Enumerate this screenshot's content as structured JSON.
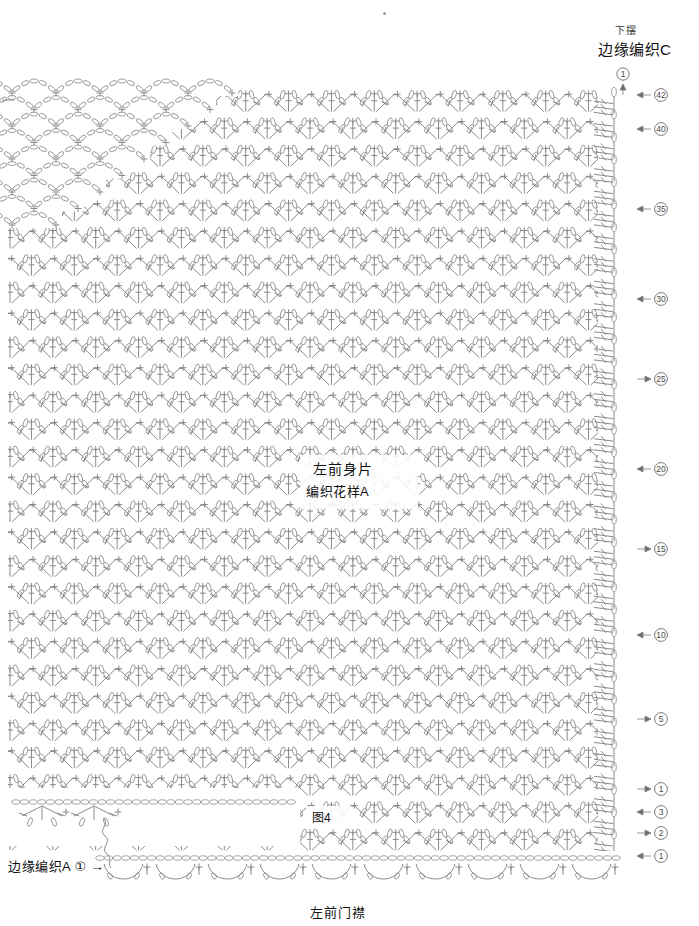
{
  "page": {
    "width": 699,
    "height": 926,
    "background": "#ffffff",
    "line_color": "#8a8a8a",
    "ink_color": "#1a1a1a",
    "figure_id": "图4"
  },
  "labels": {
    "hem": "下摆",
    "edge_c": "边缘编织C",
    "body_piece": "左前身片",
    "pattern_a": "编织花样A",
    "figure": "图4",
    "edge_a": "边缘编织A",
    "edge_a_marker": "①",
    "front_placket": "左前门襟",
    "start_marker": "①"
  },
  "chart_data": {
    "type": "diagram",
    "subtitle": "左前门襟 / 边缘编织A / 边缘编织C",
    "grid": {
      "pattern_area": {
        "x": 10,
        "y": 88,
        "width": 600,
        "height": 766
      },
      "rows_total": 42,
      "motif_columns": 14,
      "motif_rows": 28
    },
    "row_markers": [
      {
        "label": "42",
        "y": 95,
        "arrow": "left"
      },
      {
        "label": "40",
        "y": 129,
        "arrow": "left"
      },
      {
        "label": "35",
        "y": 209,
        "arrow": "left"
      },
      {
        "label": "30",
        "y": 299,
        "arrow": "left"
      },
      {
        "label": "25",
        "y": 379,
        "arrow": "right"
      },
      {
        "label": "20",
        "y": 469,
        "arrow": "left"
      },
      {
        "label": "15",
        "y": 549,
        "arrow": "right"
      },
      {
        "label": "10",
        "y": 635,
        "arrow": "left"
      },
      {
        "label": "5",
        "y": 719,
        "arrow": "right"
      },
      {
        "label": "1",
        "y": 789,
        "arrow": "right"
      },
      {
        "label": "3",
        "y": 812,
        "arrow": "left"
      },
      {
        "label": "2",
        "y": 833,
        "arrow": "right"
      },
      {
        "label": "1",
        "y": 856,
        "arrow": "left"
      }
    ],
    "regions": [
      {
        "name": "neckline-scallop-region",
        "description": "chain arches stepped diagonally, top-left",
        "x": 8,
        "y": 88,
        "width": 230,
        "height": 150
      },
      {
        "name": "main-pattern-region",
        "description": "repeating V/chevron fan motif",
        "x": 10,
        "y": 90,
        "width": 600,
        "height": 760
      },
      {
        "name": "right-edging-column",
        "description": "edge C: chain loops and treble clusters",
        "x": 600,
        "y": 88,
        "width": 42,
        "height": 770
      },
      {
        "name": "bottom-chain-row",
        "description": "foundation chain run across base",
        "x": 100,
        "y": 855,
        "width": 520,
        "height": 8
      },
      {
        "name": "bottom-scallop-border",
        "description": "edge A scalloped arches",
        "x": 100,
        "y": 862,
        "width": 520,
        "height": 24
      },
      {
        "name": "edge-a-motif",
        "description": "small standalone stitch motif key at bottom-left",
        "x": 14,
        "y": 800,
        "width": 105,
        "height": 48
      }
    ]
  }
}
